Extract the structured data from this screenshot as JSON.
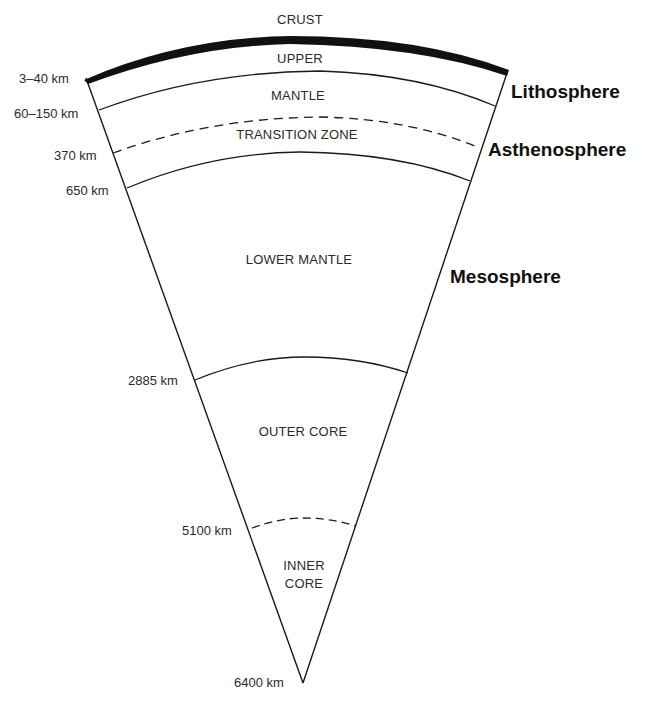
{
  "diagram": {
    "layers": [
      {
        "id": "crust",
        "label": "CRUST"
      },
      {
        "id": "upper",
        "label": "UPPER"
      },
      {
        "id": "mantle",
        "label": "MANTLE"
      },
      {
        "id": "transition",
        "label": "TRANSITION ZONE"
      },
      {
        "id": "lower_mantle",
        "label": "LOWER MANTLE"
      },
      {
        "id": "outer_core",
        "label": "OUTER CORE"
      },
      {
        "id": "inner_core_1",
        "label": "INNER"
      },
      {
        "id": "inner_core_2",
        "label": "CORE"
      }
    ],
    "depths": [
      {
        "id": "d1",
        "label": "3–40 km"
      },
      {
        "id": "d2",
        "label": "60–150 km"
      },
      {
        "id": "d3",
        "label": "370 km"
      },
      {
        "id": "d4",
        "label": "650 km"
      },
      {
        "id": "d5",
        "label": "2885 km"
      },
      {
        "id": "d6",
        "label": "5100 km"
      },
      {
        "id": "d7",
        "label": "6400 km"
      }
    ],
    "spheres": [
      {
        "id": "lithosphere",
        "label": "Lithosphere"
      },
      {
        "id": "asthenosphere",
        "label": "Asthenosphere"
      },
      {
        "id": "mesosphere",
        "label": "Mesosphere"
      }
    ],
    "colors": {
      "line": "#1a1a1a",
      "crust_fill": "#111111",
      "text": "#2a2a2a",
      "background": "#ffffff"
    }
  }
}
